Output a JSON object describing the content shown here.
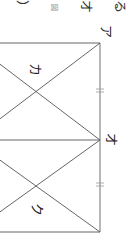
{
  "figure": {
    "type": "geometry-diagram",
    "orientation": "rotated-90deg",
    "line_color": "#555555",
    "labels": {
      "a": "ア",
      "o": "オ",
      "ka": "カ",
      "ku": "ク"
    },
    "header_fragments": {
      "text_1": "る",
      "text_2": "オ",
      "text_3": "図",
      "text_4": "）"
    },
    "tick_marks": [
      "=",
      "="
    ]
  }
}
